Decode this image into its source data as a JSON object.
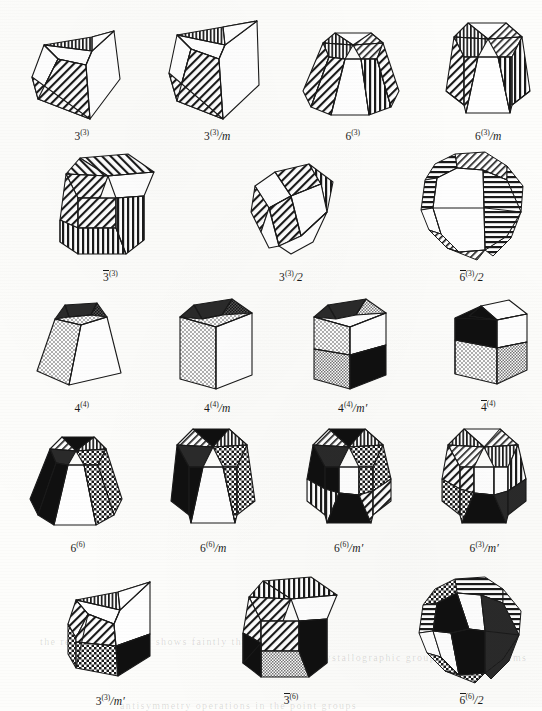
{
  "plate": {
    "kind": "crystallographic-point-group-polyhedra-plate",
    "background_color": "#fdfdfb",
    "ink_color": "#1a1a1a",
    "rows": [
      {
        "row_index": 1,
        "figures": [
          {
            "name": "fig-3-3",
            "label": {
              "base": "3",
              "superscript": "(3)",
              "suffix": "",
              "overline": false
            },
            "solid": "trigonal-pyramid-oblique",
            "fills": [
              "diagonal-hatch",
              "vertical-hatch",
              "white"
            ]
          },
          {
            "name": "fig-3-3-over-m",
            "label": {
              "base": "3",
              "superscript": "(3)",
              "suffix": "/m",
              "overline": false
            },
            "solid": "trigonal-prism",
            "fills": [
              "diagonal-hatch",
              "vertical-hatch",
              "white"
            ]
          },
          {
            "name": "fig-6-3",
            "label": {
              "base": "6",
              "superscript": "(3)",
              "suffix": "",
              "overline": false
            },
            "solid": "hexagonal-pyramid-frustum",
            "fills": [
              "diagonal-hatch",
              "vertical-hatch",
              "white"
            ]
          },
          {
            "name": "fig-6-3-over-m",
            "label": {
              "base": "6",
              "superscript": "(3)",
              "suffix": "/m",
              "overline": false
            },
            "solid": "hexagonal-prism",
            "fills": [
              "diagonal-hatch",
              "vertical-hatch",
              "white"
            ]
          }
        ]
      },
      {
        "row_index": 2,
        "figures": [
          {
            "name": "fig-3bar-3",
            "label": {
              "base": "3",
              "superscript": "(3)",
              "suffix": "",
              "overline": true
            },
            "solid": "hexagonal-prism",
            "fills": [
              "diagonal-hatch",
              "vertical-hatch",
              "white"
            ]
          },
          {
            "name": "fig-3-3-over-2",
            "label": {
              "base": "3",
              "superscript": "(3)",
              "suffix": "/2",
              "overline": false
            },
            "solid": "trigonal-trapezohedron",
            "fills": [
              "diagonal-hatch",
              "vertical-hatch",
              "white"
            ]
          },
          {
            "name": "fig-6bar-3-over-2",
            "label": {
              "base": "6",
              "superscript": "(3)",
              "suffix": "/2",
              "overline": true
            },
            "solid": "trigonal-trapezohedron-rounded",
            "fills": [
              "diagonal-hatch",
              "vertical-hatch",
              "white"
            ]
          }
        ]
      },
      {
        "row_index": 3,
        "figures": [
          {
            "name": "fig-4-4",
            "label": {
              "base": "4",
              "superscript": "(4)",
              "suffix": "",
              "overline": false
            },
            "solid": "tetragonal-pyramid-frustum",
            "fills": [
              "stipple",
              "dark-stipple",
              "white"
            ]
          },
          {
            "name": "fig-4-4-over-m",
            "label": {
              "base": "4",
              "superscript": "(4)",
              "suffix": "/m",
              "overline": false
            },
            "solid": "tetragonal-prism",
            "fills": [
              "stipple",
              "dark-stipple",
              "white"
            ]
          },
          {
            "name": "fig-4-4-over-mprime",
            "label": {
              "base": "4",
              "superscript": "(4)",
              "suffix": "/m′",
              "overline": false
            },
            "solid": "tetragonal-prism-split",
            "fills": [
              "stipple",
              "black",
              "white",
              "dark-stipple"
            ]
          },
          {
            "name": "fig-4bar-4",
            "label": {
              "base": "4",
              "superscript": "(4)",
              "suffix": "",
              "overline": true
            },
            "solid": "tetragonal-prism-quartered",
            "fills": [
              "black",
              "white",
              "stipple",
              "grey"
            ]
          }
        ]
      },
      {
        "row_index": 4,
        "figures": [
          {
            "name": "fig-6-6",
            "label": {
              "base": "6",
              "superscript": "(6)",
              "suffix": "",
              "overline": false
            },
            "solid": "hexagonal-pyramid-frustum",
            "fills": [
              "black",
              "checker",
              "white",
              "vertical-hatch",
              "diagonal-hatch"
            ]
          },
          {
            "name": "fig-6-6-over-m",
            "label": {
              "base": "6",
              "superscript": "(6)",
              "suffix": "/m",
              "overline": false
            },
            "solid": "hexagonal-prism",
            "fills": [
              "black",
              "checker",
              "white",
              "diagonal-hatch"
            ]
          },
          {
            "name": "fig-6-6-over-mprime",
            "label": {
              "base": "6",
              "superscript": "(6)",
              "suffix": "/m′",
              "overline": false
            },
            "solid": "hexagonal-prism",
            "fills": [
              "black",
              "checker",
              "white",
              "diagonal-hatch",
              "vertical-hatch"
            ]
          },
          {
            "name": "fig-6-3-over-mprime",
            "label": {
              "base": "6",
              "superscript": "(3)",
              "suffix": "/m′",
              "overline": false
            },
            "solid": "hexagonal-prism",
            "fills": [
              "black",
              "checker",
              "white",
              "diagonal-hatch",
              "vertical-hatch"
            ]
          }
        ]
      },
      {
        "row_index": 5,
        "figures": [
          {
            "name": "fig-3-3-over-mprime",
            "label": {
              "base": "3",
              "superscript": "(3)",
              "suffix": "/m′",
              "overline": false
            },
            "solid": "trigonal-prism",
            "fills": [
              "diagonal-hatch",
              "checker",
              "black",
              "vertical-hatch",
              "white"
            ]
          },
          {
            "name": "fig-3bar-6",
            "label": {
              "base": "3",
              "superscript": "(6)",
              "suffix": "",
              "overline": true
            },
            "solid": "hexagonal-prism",
            "fills": [
              "diagonal-hatch",
              "vertical-hatch",
              "black",
              "grey",
              "white"
            ]
          },
          {
            "name": "fig-6bar-6-over-2",
            "label": {
              "base": "6",
              "superscript": "(6)",
              "suffix": "/2",
              "overline": true
            },
            "solid": "trigonal-trapezohedron-rounded",
            "fills": [
              "black",
              "white",
              "checker",
              "horizontal-hatch",
              "diagonal-hatch"
            ]
          }
        ]
      }
    ],
    "bleed_through_lines": [
      "the reverse page text shows faintly through",
      "of crystallographic groups and their forms",
      "antisymmetry operations in the point groups"
    ]
  }
}
